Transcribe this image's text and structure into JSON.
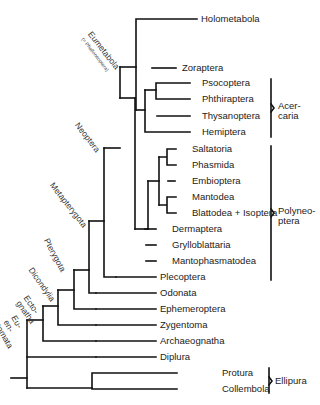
{
  "diagram": {
    "type": "phylogenetic-tree",
    "taxa": [
      {
        "name": "Holometabola",
        "y": 19
      },
      {
        "name": "Zoraptera",
        "y": 68
      },
      {
        "name": "Psocoptera",
        "y": 83
      },
      {
        "name": "Phthiraptera",
        "y": 99
      },
      {
        "name": "Thysanoptera",
        "y": 116
      },
      {
        "name": "Hemiptera",
        "y": 132
      },
      {
        "name": "Saltatoria",
        "y": 149
      },
      {
        "name": "Phasmida",
        "y": 165
      },
      {
        "name": "Embioptera",
        "y": 181
      },
      {
        "name": "Mantodea",
        "y": 197
      },
      {
        "name": "Blattodea + Isoptera",
        "y": 213
      },
      {
        "name": "Dermaptera",
        "y": 229
      },
      {
        "name": "Grylloblattaria",
        "y": 245
      },
      {
        "name": "Mantophasmatodea",
        "y": 261
      },
      {
        "name": "Plecoptera",
        "y": 277
      },
      {
        "name": "Odonata",
        "y": 293
      },
      {
        "name": "Ephemeroptera",
        "y": 309
      },
      {
        "name": "Zygentoma",
        "y": 325
      },
      {
        "name": "Archaeognatha",
        "y": 341
      },
      {
        "name": "Diplura",
        "y": 357
      },
      {
        "name": "Protura",
        "y": 373
      },
      {
        "name": "Collembola",
        "y": 389
      }
    ],
    "node_labels": [
      {
        "name": "Eumetabola",
        "sub": "(= Phalloneoptera)"
      },
      {
        "name": "Neoptera"
      },
      {
        "name": "Metapterygota"
      },
      {
        "name": "Pterygota"
      },
      {
        "name": "Dicondylia"
      },
      {
        "name": "Ecto-",
        "line2": "gnatha"
      },
      {
        "name": "Eu-",
        "line2": "en-",
        "line3": "tomata"
      }
    ],
    "brackets": [
      {
        "line1": "Acer-",
        "line2": "caria",
        "from": "Psocoptera",
        "to": "Hemiptera"
      },
      {
        "line1": "Polyneo-",
        "line2": "ptera",
        "from": "Saltatoria",
        "to": "Plecoptera"
      },
      {
        "line1": "Ellipura",
        "from": "Protura",
        "to": "Collembola"
      }
    ],
    "line_color": "#111111"
  }
}
